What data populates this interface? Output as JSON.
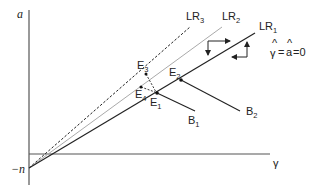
{
  "axes": {
    "y_label": "a",
    "x_label": "γ",
    "intercept_label": "−n"
  },
  "lines": [
    {
      "id": "LR1",
      "label": "LR",
      "sub": "1",
      "style": "solid",
      "color": "#222222"
    },
    {
      "id": "LR2",
      "label": "LR",
      "sub": "2",
      "style": "solid",
      "color": "#aaaaaa"
    },
    {
      "id": "LR3",
      "label": "LR",
      "sub": "3",
      "style": "dashed",
      "color": "#222222"
    }
  ],
  "points": [
    {
      "id": "E1",
      "label": "E",
      "sub": "1"
    },
    {
      "id": "E2",
      "label": "E",
      "sub": "2"
    },
    {
      "id": "E3",
      "label": "E",
      "sub": "3"
    },
    {
      "id": "E4",
      "label": "E",
      "sub": "4"
    }
  ],
  "branches": [
    {
      "id": "B1",
      "label": "B",
      "sub": "1"
    },
    {
      "id": "B2",
      "label": "B",
      "sub": "2"
    }
  ],
  "equation": {
    "lhs": "γ",
    "mid": "a",
    "rhs": "=0",
    "eq": "=",
    "hat": "^"
  }
}
